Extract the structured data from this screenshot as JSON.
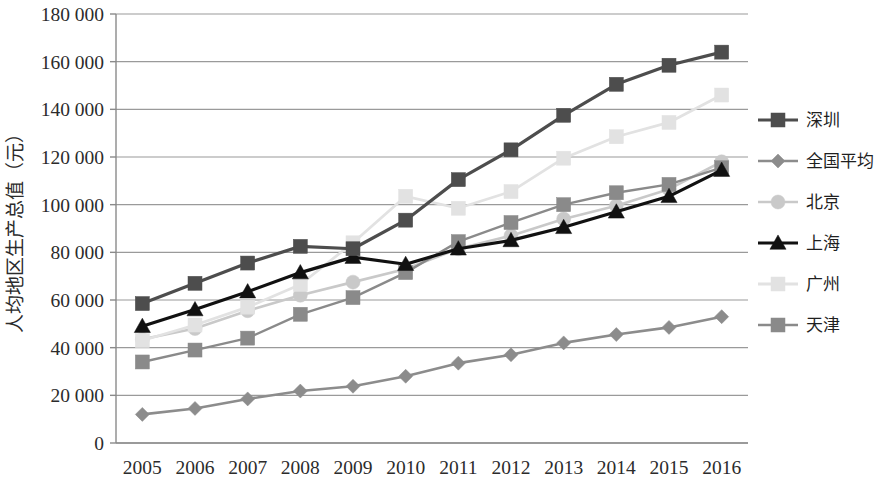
{
  "chart_data": {
    "type": "line",
    "title": "",
    "xlabel": "",
    "ylabel": "人均地区生产总值（元）",
    "categories": [
      "2005",
      "2006",
      "2007",
      "2008",
      "2009",
      "2010",
      "2011",
      "2012",
      "2013",
      "2014",
      "2015",
      "2016"
    ],
    "ylim": [
      0,
      180000
    ],
    "ytick_values": [
      0,
      20000,
      40000,
      60000,
      80000,
      100000,
      120000,
      140000,
      160000,
      180000
    ],
    "ytick_labels": [
      "0",
      "20 000",
      "40 000",
      "60 000",
      "80 000",
      "100 000",
      "120 000",
      "140 000",
      "160 000",
      "180 000"
    ],
    "grid": true,
    "legend_position": "right",
    "series": [
      {
        "name": "深圳",
        "color": "#4d4d4d",
        "marker": "square",
        "line_width": 3.2,
        "values": [
          58500,
          67000,
          75500,
          82500,
          81500,
          93500,
          110500,
          123000,
          137500,
          150500,
          158500,
          164000
        ]
      },
      {
        "name": "全国平均",
        "color": "#8c8c8c",
        "marker": "diamond",
        "line_width": 2.6,
        "values": [
          12000,
          14500,
          18500,
          21800,
          23800,
          28000,
          33500,
          37000,
          42000,
          45500,
          48500,
          53000
        ]
      },
      {
        "name": "北京",
        "color": "#c9c9c9",
        "marker": "circle",
        "line_width": 2.6,
        "values": [
          43500,
          48000,
          55500,
          62000,
          67500,
          73000,
          81500,
          87000,
          94000,
          99500,
          106500,
          118000
        ]
      },
      {
        "name": "上海",
        "color": "#111111",
        "marker": "triangle",
        "line_width": 3.2,
        "values": [
          49000,
          56000,
          63500,
          71500,
          78000,
          75000,
          81500,
          85000,
          90500,
          97000,
          103500,
          114500
        ]
      },
      {
        "name": "广州",
        "color": "#e2e2e2",
        "marker": "square",
        "line_width": 2.8,
        "values": [
          43000,
          49500,
          57000,
          66500,
          84000,
          103500,
          98500,
          105500,
          119500,
          128500,
          134500,
          146000
        ]
      },
      {
        "name": "天津",
        "color": "#8a8a8a",
        "marker": "square",
        "line_width": 2.4,
        "values": [
          34000,
          39000,
          44000,
          54000,
          61000,
          71500,
          84500,
          92500,
          100000,
          105000,
          108500,
          115500
        ]
      }
    ]
  },
  "axis": {
    "y_axis_title": "人均地区生产总值（元）"
  },
  "legend": {
    "entries": [
      {
        "label": "深圳"
      },
      {
        "label": "全国平均"
      },
      {
        "label": "北京"
      },
      {
        "label": "上海"
      },
      {
        "label": "广州"
      },
      {
        "label": "天津"
      }
    ]
  },
  "colors": {
    "axis": "#8a8a8a",
    "grid": "#9a9a9a",
    "text": "#2b2b2b",
    "background": "#ffffff"
  }
}
